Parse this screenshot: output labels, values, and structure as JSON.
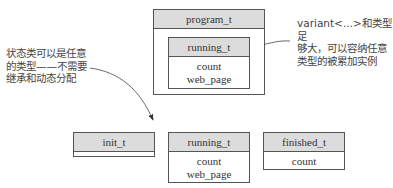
{
  "diagram": {
    "container": {
      "title": "program_t",
      "inner": {
        "title": "running_t",
        "fields": [
          "count",
          "web_page"
        ]
      }
    },
    "states": [
      {
        "title": "init_t",
        "fields": []
      },
      {
        "title": "running_t",
        "fields": [
          "count",
          "web_page"
        ]
      },
      {
        "title": "finished_t",
        "fields": [
          "count"
        ]
      }
    ],
    "annotations": {
      "left": [
        "状态类可以是任意",
        "的类型——不需要",
        "继承和动态分配"
      ],
      "right": [
        "variant<...>和类型足",
        "够大，可以容纳任意",
        "类型的被累加实例"
      ]
    },
    "colors": {
      "header_fill": "#dcdcdc",
      "border": "#555555",
      "text": "#333333"
    }
  }
}
